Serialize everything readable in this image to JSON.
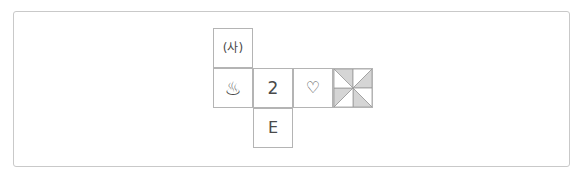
{
  "figure": {
    "title": "",
    "frame": {
      "border_color": "#c9c9c9",
      "background": "#ffffff"
    },
    "grid": {
      "cell_size_px": 40,
      "columns": 4,
      "rows": 3,
      "line_color": "#b4b4b4",
      "cell_background": "#ffffff"
    },
    "cells": [
      {
        "id": "cell-r0c0",
        "row": 0,
        "col": 0,
        "kind": "text",
        "icon_name": "korean-sa-parenthesis-glyph",
        "text": "(사)"
      },
      {
        "id": "cell-r1c0",
        "row": 1,
        "col": 0,
        "kind": "text",
        "icon_name": "hot-spring-onsen-icon",
        "text": "♨"
      },
      {
        "id": "cell-r1c1",
        "row": 1,
        "col": 1,
        "kind": "text",
        "icon_name": "digit-two-glyph",
        "text": "2"
      },
      {
        "id": "cell-r1c2",
        "row": 1,
        "col": 2,
        "kind": "text",
        "icon_name": "heart-outline-icon",
        "text": "♡"
      },
      {
        "id": "cell-r1c3",
        "row": 1,
        "col": 3,
        "kind": "pattern",
        "icon_name": "pinwheel-eight-triangle-pattern",
        "text": ""
      },
      {
        "id": "cell-r2c1",
        "row": 2,
        "col": 1,
        "kind": "text",
        "icon_name": "letter-e-glyph",
        "text": "E"
      }
    ],
    "pinwheel": {
      "segments": 8,
      "shaded_color": "#d5d5d5",
      "blank_color": "#ffffff",
      "stroke_color": "#9a9a9a",
      "shaded_indices": [
        0,
        2,
        4,
        6
      ]
    }
  }
}
